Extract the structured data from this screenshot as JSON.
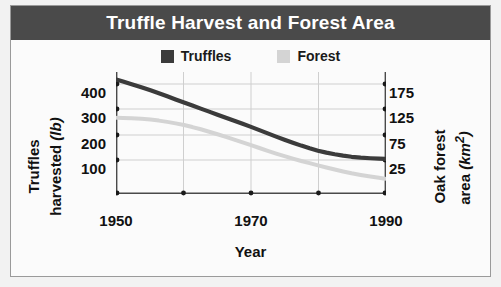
{
  "header": {
    "title": "Truffle Harvest and Forest Area"
  },
  "legend": {
    "entries": [
      {
        "label": "Truffles",
        "color": "#3b3b3b"
      },
      {
        "label": "Forest",
        "color": "#d4d4d4"
      }
    ]
  },
  "axes": {
    "left": {
      "title_line1": "Truffles",
      "title_line2": "harvested ",
      "title_unit": "(lb)",
      "ticks": [
        "400",
        "300",
        "200",
        "100"
      ]
    },
    "right": {
      "title_line1": "Oak forest",
      "title_line2": "area ",
      "title_unit": "(km",
      "title_unit_sup": "2",
      "title_unit_end": ")",
      "ticks": [
        "175",
        "125",
        "75",
        "25"
      ]
    },
    "bottom": {
      "title": "Year",
      "ticks": [
        "1950",
        "1970",
        "1990"
      ]
    }
  },
  "chart_data": {
    "type": "line",
    "title": "Truffle Harvest and Forest Area",
    "xlabel": "Year",
    "x": [
      1950,
      1955,
      1960,
      1965,
      1970,
      1975,
      1980,
      1985,
      1990
    ],
    "xlim": [
      1950,
      1990
    ],
    "xticks": [
      1950,
      1960,
      1970,
      1980,
      1990
    ],
    "xticklabels": [
      "1950",
      "",
      "1970",
      "",
      "1990"
    ],
    "grid": true,
    "legend_position": "top-center",
    "series": [
      {
        "name": "Truffles",
        "color": "#3b3b3b",
        "axis": "left",
        "ylabel": "Truffles harvested (lb)",
        "ylim": [
          50,
          450
        ],
        "yticks": [
          100,
          200,
          300,
          400
        ],
        "values": [
          425,
          390,
          350,
          310,
          270,
          228,
          192,
          172,
          165
        ]
      },
      {
        "name": "Forest",
        "color": "#d4d4d4",
        "axis": "right",
        "ylabel": "Oak forest area (km2)",
        "ylim": [
          0,
          200
        ],
        "yticks": [
          25,
          75,
          125,
          175
        ],
        "values": [
          125,
          122,
          113,
          98,
          80,
          62,
          47,
          34,
          25
        ]
      }
    ]
  }
}
